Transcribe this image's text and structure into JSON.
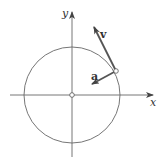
{
  "diagram": {
    "title": "",
    "axes": {
      "x_label": "x",
      "y_label": "y"
    },
    "vectors": {
      "velocity_label": "v",
      "acceleration_label": "a"
    },
    "colors": {
      "line": "#555555",
      "vector": "#555555",
      "background": "#ffffff"
    },
    "geometry": {
      "center": [
        72,
        95
      ],
      "radius": 48,
      "point_on_circle": [
        116,
        71
      ]
    }
  }
}
